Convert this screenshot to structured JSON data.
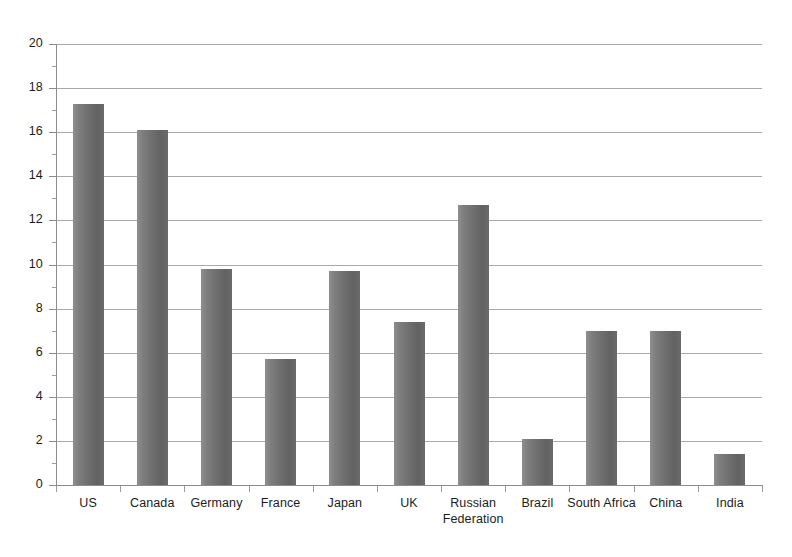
{
  "chart_data": {
    "type": "bar",
    "title": "",
    "subtitle": "",
    "xlabel": "",
    "ylabel": "",
    "categories": [
      "US",
      "Canada",
      "Germany",
      "France",
      "Japan",
      "UK",
      "Russian Federation",
      "Brazil",
      "South Africa",
      "China",
      "India"
    ],
    "values": [
      17.3,
      16.1,
      9.8,
      5.7,
      9.7,
      7.4,
      12.7,
      2.1,
      7.0,
      7.0,
      1.4
    ],
    "ylim": [
      0,
      20
    ],
    "ytick_labels": [
      "0",
      "2",
      "4",
      "6",
      "8",
      "10",
      "12",
      "14",
      "16",
      "18",
      "20"
    ],
    "ytick_values": [
      0,
      2,
      4,
      6,
      8,
      10,
      12,
      14,
      16,
      18,
      20
    ],
    "grid": true,
    "grid_axis": "y",
    "legend": false,
    "legend_position": "none",
    "bar_color": "#6f6f6f",
    "grid_color": "#a9a9a9",
    "axis_color": "#8c8c8c",
    "background_color": "#ffffff",
    "text_color": "#1c1c1c"
  }
}
